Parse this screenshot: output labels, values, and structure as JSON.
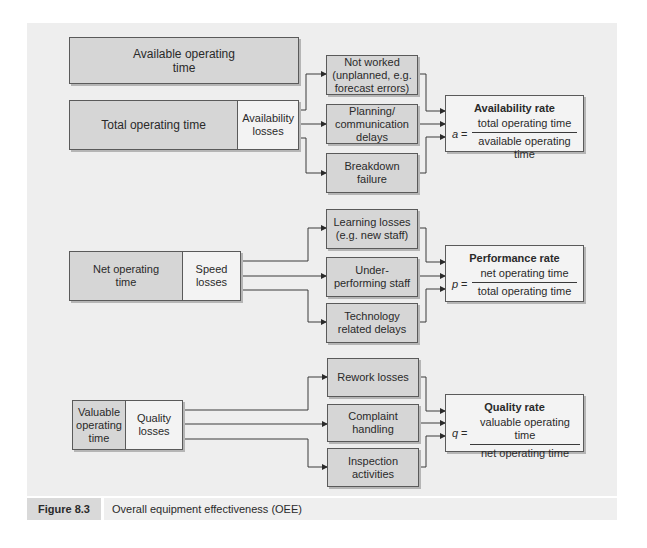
{
  "availability": {
    "available_time": "Available operating time",
    "total_time": "Total operating time",
    "losses_label": "Availability losses",
    "loss_items": [
      "Not worked (unplanned, e.g. forecast errors)",
      "Planning/ communication delays",
      "Breakdown failure"
    ],
    "rate": {
      "title": "Availability rate",
      "variable": "a",
      "equals": "=",
      "numerator": "total operating time",
      "denominator": "available operating time"
    }
  },
  "performance": {
    "net_time": "Net operating time",
    "losses_label": "Speed losses",
    "loss_items": [
      "Learning losses (e.g. new staff)",
      "Under-performing staff",
      "Technology related delays"
    ],
    "rate": {
      "title": "Performance rate",
      "variable": "p",
      "equals": "=",
      "numerator": "net operating time",
      "denominator": "total operating time"
    }
  },
  "quality": {
    "valuable_time": "Valuable operating time",
    "losses_label": "Quality losses",
    "loss_items": [
      "Rework losses",
      "Complaint handling",
      "Inspection activities"
    ],
    "rate": {
      "title": "Quality rate",
      "variable": "q",
      "equals": "=",
      "numerator": "valuable operating time",
      "denominator": "net operating time"
    }
  },
  "caption": {
    "label": "Figure 8.3",
    "text": "Overall equipment effectiveness (OEE)"
  },
  "colors": {
    "panel": "#eeeeee",
    "dark_box": "#d6d6d6",
    "light_box": "#f3f3f3",
    "border": "#5a5a5a"
  }
}
